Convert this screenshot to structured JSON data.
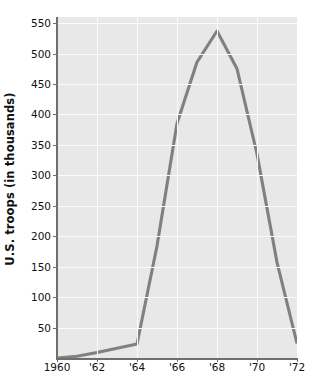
{
  "chart_data": {
    "type": "line",
    "title": "",
    "xlabel": "",
    "ylabel": "U.S. troops (in thousands)",
    "xlim": [
      1960,
      1972
    ],
    "ylim": [
      0,
      560
    ],
    "grid": true,
    "legend": false,
    "line_color": "#808080",
    "plot_background": "#e8e8e8",
    "gridline_color": "#fbfbfb",
    "axis_color": "#6e6e6e",
    "x": [
      1960,
      1961,
      1962,
      1963,
      1964,
      1965,
      1966,
      1967,
      1968,
      1969,
      1970,
      1971,
      1972
    ],
    "values": [
      0,
      3,
      9,
      16,
      23,
      184,
      385,
      486,
      537,
      475,
      335,
      157,
      24
    ],
    "x_tick_values": [
      1960,
      1962,
      1964,
      1966,
      1968,
      1970,
      1972
    ],
    "x_tick_labels": [
      "1960",
      "'62",
      "'64",
      "'66",
      "'68",
      "'70",
      "'72"
    ],
    "y_tick_values": [
      50,
      100,
      150,
      200,
      250,
      300,
      350,
      400,
      450,
      500,
      550
    ],
    "y_tick_labels": [
      "50",
      "100",
      "150",
      "200",
      "250",
      "300",
      "350",
      "400",
      "450",
      "500",
      "550"
    ]
  }
}
